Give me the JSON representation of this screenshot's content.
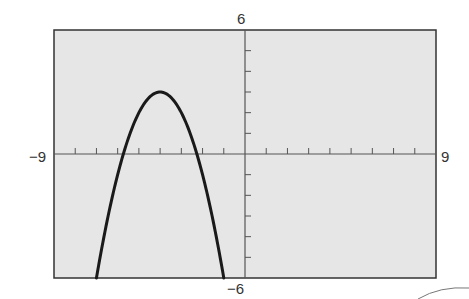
{
  "chart_data": {
    "type": "line",
    "title": "",
    "xlabel": "",
    "ylabel": "",
    "xlim": [
      -9,
      9
    ],
    "ylim": [
      -6,
      6
    ],
    "x_tick_step": 1,
    "y_tick_step": 1,
    "grid": false,
    "tick_labels": {
      "xmin": "−9",
      "xmax": "9",
      "ymin": "−6",
      "ymax": "6"
    },
    "series": [
      {
        "name": "parabola",
        "equation": "y = -(x+4)^2 + 3",
        "vertex": [
          -4,
          3
        ],
        "x_intercepts": [
          -5.73,
          -2.27
        ],
        "x": [
          -7,
          -6.5,
          -6,
          -5.5,
          -5,
          -4.5,
          -4,
          -3.5,
          -3,
          -2.5,
          -2,
          -1.5,
          -1
        ],
        "values": [
          -6,
          -3.25,
          -1,
          0.75,
          2,
          2.75,
          3,
          2.75,
          2,
          0.75,
          -1,
          -3.25,
          -6
        ]
      }
    ]
  },
  "colors": {
    "plot_bg": "#e6e6e6",
    "curve": "#1a1a1a",
    "axis": "#555555",
    "frame": "#333333"
  }
}
